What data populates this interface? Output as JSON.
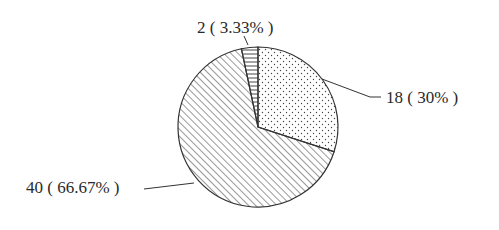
{
  "chart_data": {
    "type": "pie",
    "title": "",
    "total": 60,
    "slices": [
      {
        "label": "2 ( 3.33% )",
        "value": 2,
        "percent": 3.33,
        "pattern": "horizontal-lines"
      },
      {
        "label": "18 ( 30% )",
        "value": 18,
        "percent": 30,
        "pattern": "dots"
      },
      {
        "label": "40 ( 66.67% )",
        "value": 40,
        "percent": 66.67,
        "pattern": "diagonal-hatch"
      }
    ],
    "start_angle_deg": -12,
    "direction": "clockwise",
    "legend": "none",
    "colors": {
      "stroke": "#333333",
      "background": "#ffffff"
    }
  }
}
